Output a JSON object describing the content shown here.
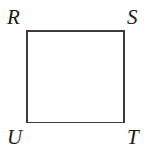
{
  "figure": {
    "type": "square",
    "stroke_color": "#3c3c3c",
    "fill_color": "#ffffff",
    "background_color": "#ffffff",
    "label_color": "#1a1a1a",
    "stroke_width": 1.6,
    "square": {
      "x": 26,
      "y": 31,
      "width": 98,
      "height": 91
    },
    "vertices": [
      {
        "id": "R",
        "label": "R",
        "position": "top-left"
      },
      {
        "id": "S",
        "label": "S",
        "position": "top-right"
      },
      {
        "id": "T",
        "label": "T",
        "position": "bottom-right"
      },
      {
        "id": "U",
        "label": "U",
        "position": "bottom-left"
      }
    ]
  }
}
